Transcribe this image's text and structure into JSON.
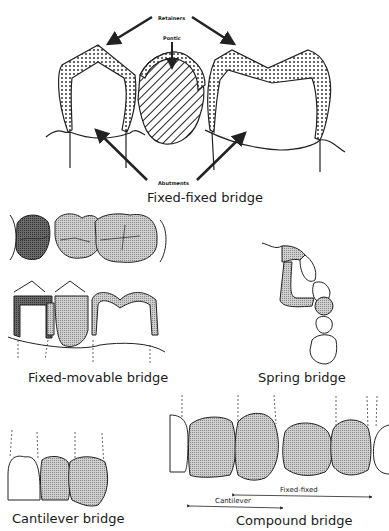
{
  "figures": {
    "fixed_fixed": {
      "caption": "Fixed-fixed bridge",
      "labels": {
        "retainers": "Retainers",
        "pontic": "Pontic",
        "abutments": "Abutments"
      }
    },
    "fixed_movable": {
      "caption": "Fixed-movable bridge"
    },
    "spring": {
      "caption": "Spring bridge"
    },
    "cantilever": {
      "caption": "Cantilever bridge"
    },
    "compound": {
      "caption": "Compound bridge",
      "labels": {
        "fixed_fixed": "Fixed-fixed",
        "cantilever": "Cantilever"
      }
    }
  }
}
